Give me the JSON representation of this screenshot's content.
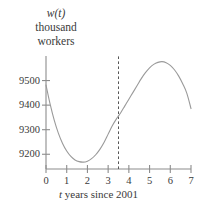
{
  "chart_data": {
    "type": "line",
    "title": "",
    "ylabel_lines": [
      "w(t)",
      "thousand",
      "workers"
    ],
    "ylabel": "w(t) thousand workers",
    "xlabel": "t years since 2001",
    "xlabel_var": "t",
    "xlabel_rest": " years since 2001",
    "xlim": [
      0,
      7
    ],
    "ylim": [
      9140,
      9600
    ],
    "grid": false,
    "legend": null,
    "xticks": [
      0,
      1,
      2,
      3,
      4,
      5,
      6,
      7
    ],
    "xtick_labels": [
      "0",
      "1",
      "2",
      "3",
      "4",
      "5",
      "6",
      "7"
    ],
    "yticks": [
      9200,
      9300,
      9400,
      9500
    ],
    "ytick_labels": [
      "9200",
      "9300",
      "9400",
      "9500"
    ],
    "curve_color": "#9a9a9a",
    "axis_color": "#8c8c8c",
    "text_color": "#3a3a3a",
    "annotations": [
      {
        "kind": "vertical-dashed-line",
        "x": 3.5,
        "label": "",
        "style": "dashed"
      }
    ],
    "series": [
      {
        "name": "w(t)",
        "x": [
          0.0,
          0.2,
          0.4,
          0.6,
          0.8,
          1.0,
          1.2,
          1.4,
          1.6,
          1.8,
          2.0,
          2.2,
          2.4,
          2.6,
          2.8,
          3.0,
          3.2,
          3.4,
          3.5,
          3.6,
          3.8,
          4.0,
          4.2,
          4.4,
          4.6,
          4.8,
          5.0,
          5.2,
          5.4,
          5.6,
          5.8,
          6.0,
          6.2,
          6.4,
          6.6,
          6.8,
          7.0
        ],
        "values": [
          9482,
          9404,
          9338,
          9285,
          9244,
          9213,
          9191,
          9177,
          9170,
          9168,
          9172,
          9182,
          9198,
          9220,
          9248,
          9282,
          9316,
          9344,
          9356,
          9368,
          9396,
          9424,
          9452,
          9480,
          9508,
          9532,
          9552,
          9566,
          9574,
          9577,
          9573,
          9562,
          9544,
          9519,
          9487,
          9448,
          9386
        ]
      }
    ]
  },
  "figure": {
    "background_color": "#ffffff"
  }
}
